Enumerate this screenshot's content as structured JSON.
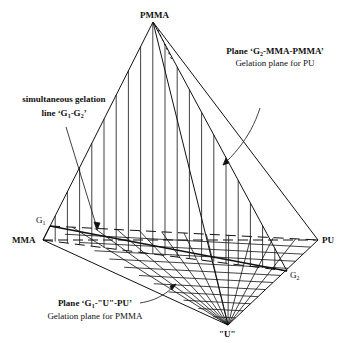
{
  "diagram": {
    "vertices": {
      "apex": {
        "label": "PMMA",
        "x": 153,
        "y": 22
      },
      "left": {
        "label": "MMA",
        "x": 43,
        "y": 240
      },
      "right": {
        "label": "PU",
        "x": 318,
        "y": 240
      },
      "bottom": {
        "label": "\"U\"",
        "x": 228,
        "y": 325
      },
      "g1": {
        "label": "G",
        "sub": "1",
        "x": 50,
        "y": 226
      },
      "g2": {
        "label": "G",
        "sub": "2",
        "x": 287,
        "y": 271
      }
    },
    "annotations": {
      "top_right": {
        "title_pre": "Plane ‘G",
        "title_sub": "2",
        "title_post": "-MMA-PMMA’",
        "subtitle": "Gelation plane for PU"
      },
      "left": {
        "line1": "simultaneous gelation",
        "line2_pre": "line ‘G",
        "line2_sub1": "1",
        "line2_mid": "-G",
        "line2_sub2": "2",
        "line2_post": "’"
      },
      "bottom": {
        "title_pre": "Plane ‘G",
        "title_sub": "1",
        "title_post": "-\"U\"-PU’",
        "subtitle": "Gelation plane for PMMA"
      }
    },
    "colors": {
      "ink": "#111111",
      "background": "#ffffff"
    }
  }
}
